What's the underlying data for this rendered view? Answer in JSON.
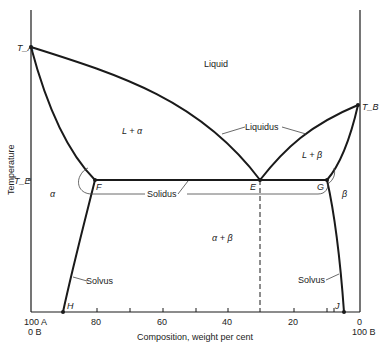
{
  "diagram": {
    "type": "binary eutectic phase diagram",
    "colors": {
      "line": "#1a1a1a",
      "background": "#ffffff",
      "text": "#222222"
    },
    "axes": {
      "y_label": "Temperature",
      "x_label": "Composition, weight per cent",
      "x_left_label_top": "100 A",
      "x_left_label_bottom": "0 B",
      "x_right_label_top": "0",
      "x_right_label_bottom": "100 B",
      "x_ticks": [
        "80",
        "60",
        "40",
        "20"
      ],
      "y_tick_label": "T_E"
    },
    "points": {
      "TA": "T_A",
      "TB": "T_B",
      "F": "F",
      "E": "E",
      "G": "G",
      "H": "H",
      "J": "J"
    },
    "regions": {
      "liquid": "Liquid",
      "l_alpha": "L + α",
      "l_beta": "L + β",
      "alpha": "α",
      "beta": "β",
      "alpha_beta": "α + β"
    },
    "curve_labels": {
      "liquidus": "Liquidus",
      "solidus": "Solidus",
      "solvus_left": "Solvus",
      "solvus_right": "Solvus"
    }
  }
}
